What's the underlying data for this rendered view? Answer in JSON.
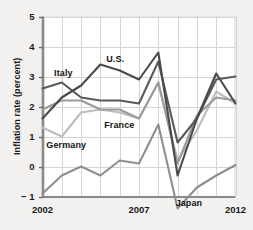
{
  "chart_data": {
    "type": "line",
    "title": "",
    "xlabel": "",
    "ylabel": "Inflation rate (percent)",
    "xlim": [
      2002,
      2012
    ],
    "ylim": [
      -1,
      5
    ],
    "grid": true,
    "legend_position": "inline-annotations",
    "x": [
      2002,
      2003,
      2004,
      2005,
      2006,
      2007,
      2008,
      2009,
      2010,
      2011,
      2012
    ],
    "ytick_labels": [
      "5",
      "4",
      "3",
      "2",
      "1",
      "0",
      "− 1"
    ],
    "ytick_values": [
      5,
      4,
      3,
      2,
      1,
      0,
      -1
    ],
    "xtick_labels": [
      "2002",
      "2007",
      "2012"
    ],
    "xtick_values": [
      2002,
      2007,
      2012
    ],
    "series": [
      {
        "name": "U.S.",
        "color": "#4a4a4a",
        "values": [
          1.6,
          2.3,
          2.7,
          3.4,
          3.2,
          2.9,
          3.8,
          -0.3,
          1.6,
          3.1,
          2.1
        ]
      },
      {
        "name": "Italy",
        "color": "#5a5a5a",
        "values": [
          2.6,
          2.8,
          2.3,
          2.2,
          2.2,
          2.1,
          3.5,
          0.8,
          1.6,
          2.9,
          3.0
        ]
      },
      {
        "name": "France",
        "color": "#9b9b9b",
        "values": [
          1.9,
          2.2,
          2.2,
          1.9,
          1.9,
          1.6,
          2.8,
          0.1,
          1.7,
          2.3,
          2.2
        ]
      },
      {
        "name": "Germany",
        "color": "#bdbdbd",
        "values": [
          1.3,
          1.0,
          1.8,
          1.9,
          1.8,
          1.6,
          2.8,
          0.2,
          1.2,
          2.5,
          2.1
        ]
      },
      {
        "name": "Japan",
        "color": "#8f8f8f",
        "values": [
          -0.9,
          -0.3,
          0.0,
          -0.3,
          0.2,
          0.1,
          1.4,
          -1.4,
          -0.7,
          -0.3,
          0.05
        ]
      }
    ],
    "annotations": [
      {
        "text": "Italy",
        "x": 2002.6,
        "y": 3.1
      },
      {
        "text": "U.S.",
        "x": 2005.3,
        "y": 3.55
      },
      {
        "text": "France",
        "x": 2005.2,
        "y": 1.35
      },
      {
        "text": "Germany",
        "x": 2002.2,
        "y": 0.68
      },
      {
        "text": "Japan",
        "x": 2008.9,
        "y": -1.25
      }
    ]
  }
}
